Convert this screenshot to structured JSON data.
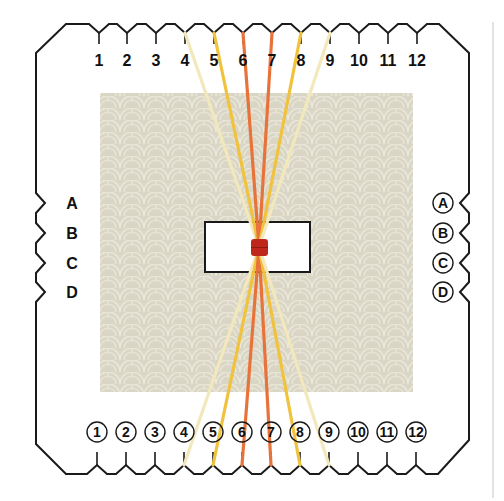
{
  "diagram": {
    "colors": {
      "outline": "#1a1a1a",
      "fabric": "#d9d6c6",
      "fabric_pattern": "#ebe8dc",
      "cream": "#f2e8bc",
      "gold": "#f0c23e",
      "orange": "#e8733a",
      "knot": "#c0271c",
      "side_rule": "#c8c8c8"
    },
    "top_slots": [
      {
        "label": "1",
        "x": 99
      },
      {
        "label": "2",
        "x": 127
      },
      {
        "label": "3",
        "x": 156
      },
      {
        "label": "4",
        "x": 185
      },
      {
        "label": "5",
        "x": 214
      },
      {
        "label": "6",
        "x": 243
      },
      {
        "label": "7",
        "x": 272
      },
      {
        "label": "8",
        "x": 301
      },
      {
        "label": "9",
        "x": 330
      },
      {
        "label": "10",
        "x": 359
      },
      {
        "label": "11",
        "x": 388
      },
      {
        "label": "12",
        "x": 417
      }
    ],
    "bottom_slots": [
      {
        "label": "1",
        "x": 97
      },
      {
        "label": "2",
        "x": 126
      },
      {
        "label": "3",
        "x": 155
      },
      {
        "label": "4",
        "x": 184
      },
      {
        "label": "5",
        "x": 213
      },
      {
        "label": "6",
        "x": 242
      },
      {
        "label": "7",
        "x": 271
      },
      {
        "label": "8",
        "x": 300
      },
      {
        "label": "9",
        "x": 329
      },
      {
        "label": "10",
        "x": 358
      },
      {
        "label": "11",
        "x": 387
      },
      {
        "label": "12",
        "x": 416
      }
    ],
    "left_slots": [
      {
        "label": "A",
        "y": 203
      },
      {
        "label": "B",
        "y": 233
      },
      {
        "label": "C",
        "y": 263
      },
      {
        "label": "D",
        "y": 292
      }
    ],
    "right_slots": [
      {
        "label": "A",
        "y": 203
      },
      {
        "label": "B",
        "y": 233
      },
      {
        "label": "C",
        "y": 263
      },
      {
        "label": "D",
        "y": 292
      }
    ],
    "threads": [
      {
        "slot": "4",
        "color": "cream"
      },
      {
        "slot": "5",
        "color": "gold"
      },
      {
        "slot": "6",
        "color": "orange"
      },
      {
        "slot": "7",
        "color": "orange"
      },
      {
        "slot": "8",
        "color": "gold"
      },
      {
        "slot": "9",
        "color": "cream"
      }
    ]
  }
}
